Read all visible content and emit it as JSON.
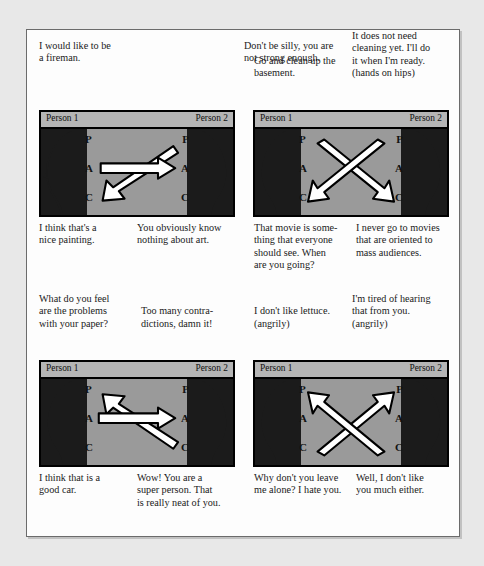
{
  "page": {
    "person_left_label": "Person 1",
    "person_right_label": "Person 2",
    "ego_states": [
      "P",
      "A",
      "C"
    ],
    "colors": {
      "panel_background": "#9a9a9a",
      "panel_header": "#b5b5b5",
      "head_silhouette": "#1b1b1b",
      "arrow_fill": "#ffffff",
      "arrow_outline": "#000000",
      "page_background": "#fdfdfd",
      "outer_background": "#e8e8e8"
    }
  },
  "panels": [
    {
      "id": "panel-1",
      "arrow_type": "crossed-complementary-down",
      "person_left": "Person 1",
      "person_right": "Person 2",
      "caption_above_left": "I would like to be\na fireman.",
      "caption_above_right": "Don't be silly, you are\nnot strong enough.",
      "caption_below_left": "I think that's a\nnice painting.",
      "caption_below_right": "You obviously know\nnothing about art."
    },
    {
      "id": "panel-2",
      "arrow_type": "crossed-x-down",
      "person_left": "Person 1",
      "person_right": "Person 2",
      "caption_above_left": "Go and clean up the\nbasement.",
      "caption_above_right": "It does not need\ncleaning yet. I'll do\nit when I'm ready.\n(hands on hips)",
      "caption_below_left": "That movie is some-\nthing that everyone\nshould see. When\nare you going?",
      "caption_below_right": "I never go to movies\nthat are oriented to\nmass audiences."
    },
    {
      "id": "panel-3",
      "arrow_type": "crossed-complementary-up",
      "person_left": "Person 1",
      "person_right": "Person 2",
      "caption_above_left": "What do you feel\nare the problems\nwith your paper?",
      "caption_above_right": "Too many contra-\ndictions, damn it!",
      "caption_below_left": "I think that is a\ngood car.",
      "caption_below_right": "Wow! You are a\nsuper person. That\nis really neat of you."
    },
    {
      "id": "panel-4",
      "arrow_type": "crossed-x-up",
      "person_left": "Person 1",
      "person_right": "Person 2",
      "caption_above_left": "I don't like lettuce.\n(angrily)",
      "caption_above_right": "I'm tired of hearing\nthat from you.\n(angrily)",
      "caption_below_left": "Why don't you leave\nme alone? I hate you.",
      "caption_below_right": "Well, I don't like\nyou  much either."
    }
  ]
}
